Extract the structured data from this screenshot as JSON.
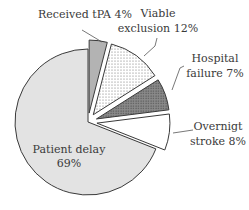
{
  "chart_data": {
    "type": "pie",
    "title": "",
    "start_angle_deg": 0,
    "direction": "clockwise",
    "slices": [
      {
        "label": "Received tPA",
        "value": 4,
        "display": "Received tPA 4%",
        "fill": "#b3b3b3",
        "pattern": "solid",
        "exploded": true
      },
      {
        "label": "Viable exclusion",
        "value": 12,
        "display": "Viable exclusion 12%",
        "fill": "#ffffff",
        "pattern": "light-dots",
        "exploded": true
      },
      {
        "label": "Hospital failure",
        "value": 7,
        "display": "Hospital failure 7%",
        "fill": "#8c8c8c",
        "pattern": "dense-dots",
        "exploded": true
      },
      {
        "label": "Overnigt stroke",
        "value": 8,
        "display": "Overnigt stroke 8%",
        "fill": "#ffffff",
        "pattern": "none",
        "exploded": true
      },
      {
        "label": "Patient delay",
        "value": 69,
        "display": "Patient delay 69%",
        "fill": "#e3e3e3",
        "pattern": "solid",
        "exploded": false
      }
    ],
    "legend": "none (direct labels with leader lines)"
  },
  "labels": {
    "tpa": "Received tPA 4%",
    "viable_1": "Viable",
    "viable_2": "exclusion 12%",
    "hospital_1": "Hospital",
    "hospital_2": "failure 7%",
    "overnight_1": "Overnigt",
    "overnight_2": "stroke 8%",
    "patient_1": "Patient delay",
    "patient_2": "69%"
  }
}
